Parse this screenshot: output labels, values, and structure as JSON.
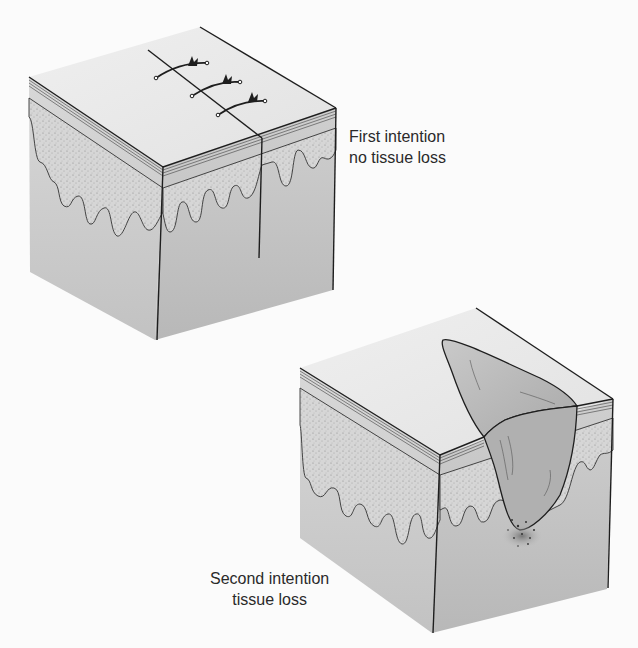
{
  "figure": {
    "panels": [
      {
        "id": "first-intention",
        "label_line1": "First intention",
        "label_line2": "no tissue loss",
        "sutures": 3
      },
      {
        "id": "second-intention",
        "label_line1": "Second intention",
        "label_line2": "tissue loss"
      }
    ]
  },
  "colors": {
    "background": "#fbfbfb",
    "block_top": "#ececec",
    "block_left": "#c8c8c8",
    "block_right": "#bdbdbd",
    "dermis_dots": "#9a9a9a",
    "outline": "#1e1e1e",
    "wound_fill": "#b8b8b8",
    "label_text": "#2a2a2a"
  }
}
